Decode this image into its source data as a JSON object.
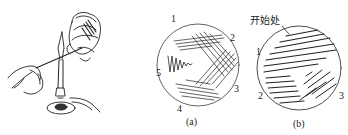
{
  "figure": {
    "panel_left": {
      "description": "hand holding inoculating loop over Bunsen burner flame, other hand holding petri dish"
    },
    "panel_a": {
      "caption": "(a)",
      "region_labels": [
        "1",
        "2",
        "3",
        "4",
        "5"
      ],
      "description": "streak plate with five regions of crossing parallel lines and a zigzag"
    },
    "panel_b": {
      "caption": "(b)",
      "start_label": "开始处",
      "region_labels": [
        "1",
        "2",
        "3"
      ],
      "description": "continuous streak plate with dense parallel strokes"
    }
  }
}
